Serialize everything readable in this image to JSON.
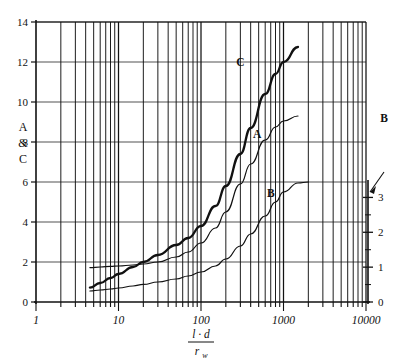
{
  "chart_data": {
    "type": "line",
    "title": "",
    "xlabel": "l · d / r_w",
    "xlabel_numerator": "l · d",
    "xlabel_denominator": "r",
    "xlabel_denominator_sub": "w",
    "xscale": "log",
    "xlim": [
      1,
      10000
    ],
    "xticks": [
      1,
      10,
      100,
      1000,
      10000
    ],
    "xticklabels": [
      "1",
      "10",
      "100",
      "1000",
      "10000"
    ],
    "ylabel": "A & C",
    "ylabel_lines": [
      "A",
      "&",
      "C"
    ],
    "ylim": [
      0,
      14
    ],
    "yticks": [
      0,
      2,
      4,
      6,
      8,
      10,
      12,
      14
    ],
    "yticklabels": [
      "0",
      "2",
      "4",
      "6",
      "8",
      "10",
      "12",
      "14"
    ],
    "y2label": "B",
    "y2lim": [
      0,
      3.5
    ],
    "y2ticks": [
      0,
      1,
      2,
      3
    ],
    "y2ticklabels": [
      "0",
      "1",
      "2",
      "3"
    ],
    "grid": "log-minor-vertical-and-major-horizontal",
    "legend": "inline-curve-labels",
    "series": [
      {
        "name": "C",
        "label": "C",
        "axis": "left",
        "style": "thick",
        "points": [
          [
            4.5,
            0.72
          ],
          [
            6,
            0.95
          ],
          [
            8,
            1.2
          ],
          [
            10,
            1.4
          ],
          [
            15,
            1.75
          ],
          [
            20,
            2.0
          ],
          [
            30,
            2.35
          ],
          [
            50,
            2.85
          ],
          [
            70,
            3.2
          ],
          [
            100,
            3.8
          ],
          [
            150,
            4.8
          ],
          [
            200,
            5.8
          ],
          [
            300,
            7.4
          ],
          [
            400,
            8.7
          ],
          [
            600,
            10.4
          ],
          [
            800,
            11.4
          ],
          [
            1000,
            12.0
          ],
          [
            1500,
            12.75
          ]
        ]
      },
      {
        "name": "A",
        "label": "A",
        "axis": "left",
        "style": "thin",
        "points": [
          [
            4.5,
            1.72
          ],
          [
            6,
            1.75
          ],
          [
            8,
            1.78
          ],
          [
            10,
            1.8
          ],
          [
            15,
            1.85
          ],
          [
            20,
            1.9
          ],
          [
            30,
            2.0
          ],
          [
            50,
            2.25
          ],
          [
            70,
            2.5
          ],
          [
            100,
            2.95
          ],
          [
            150,
            3.7
          ],
          [
            200,
            4.5
          ],
          [
            300,
            5.9
          ],
          [
            400,
            6.9
          ],
          [
            600,
            8.1
          ],
          [
            800,
            8.75
          ],
          [
            1000,
            9.05
          ],
          [
            1500,
            9.3
          ]
        ]
      },
      {
        "name": "B",
        "label": "B",
        "axis": "right",
        "style": "thin",
        "points": [
          [
            4.5,
            0.55
          ],
          [
            6,
            0.6
          ],
          [
            8,
            0.65
          ],
          [
            10,
            0.7
          ],
          [
            15,
            0.8
          ],
          [
            20,
            0.88
          ],
          [
            30,
            1.0
          ],
          [
            50,
            1.15
          ],
          [
            70,
            1.3
          ],
          [
            100,
            1.5
          ],
          [
            150,
            1.8
          ],
          [
            200,
            2.15
          ],
          [
            300,
            2.8
          ],
          [
            400,
            3.4
          ],
          [
            600,
            4.3
          ],
          [
            800,
            5.0
          ],
          [
            1000,
            5.5
          ],
          [
            1500,
            5.95
          ],
          [
            2000,
            6.0
          ]
        ]
      }
    ],
    "annotations": [
      {
        "name": "curve-label-C",
        "text": "C",
        "x": 300,
        "y": 11.8
      },
      {
        "name": "curve-label-A",
        "text": "A",
        "x": 480,
        "y": 8.2
      },
      {
        "name": "curve-label-B",
        "text": "B",
        "x": 700,
        "y": 5.25
      },
      {
        "name": "right-axis-title-B",
        "text": "B",
        "x": 11000,
        "y": 9.0
      }
    ]
  }
}
